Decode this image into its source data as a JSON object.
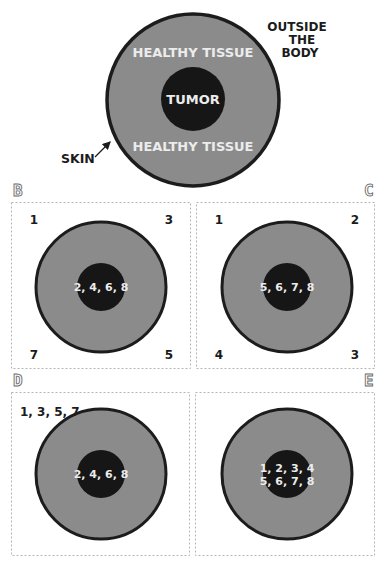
{
  "colors": {
    "tissue_fill": "#8b8b8b",
    "skin_stroke": "#1c1c1c",
    "tumor_fill": "#161616",
    "tumor_text": "#ececec",
    "label_text": "#1b1b1b",
    "panel_border": "#b4b4b4"
  },
  "main_figure": {
    "outside_label_line1": "OUTSIDE",
    "outside_label_line2": "THE",
    "outside_label_line3": "BODY",
    "healthy_top": "HEALTHY TISSUE",
    "healthy_bottom": "HEALTHY TISSUE",
    "tumor": "TUMOR",
    "skin": "SKIN"
  },
  "panels": {
    "B": {
      "letter": "B",
      "top_left": "1",
      "top_right": "3",
      "bottom_left": "7",
      "bottom_right": "5",
      "tumor_line1": "2, 4, 6, 8"
    },
    "C": {
      "letter": "C",
      "top_left": "1",
      "top_right": "2",
      "bottom_left": "4",
      "bottom_right": "3",
      "tumor_line1": "5, 6, 7, 8"
    },
    "D": {
      "letter": "D",
      "top_left": "1, 3, 5, 7",
      "tumor_line1": "2, 4, 6, 8"
    },
    "E": {
      "letter": "E",
      "tumor_line1": "1, 2, 3, 4",
      "tumor_line2": "5, 6, 7, 8"
    }
  }
}
